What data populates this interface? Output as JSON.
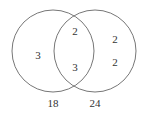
{
  "venn": {
    "sets": [
      {
        "name": "left-set",
        "label": "18"
      },
      {
        "name": "right-set",
        "label": "24"
      }
    ],
    "regions": {
      "left_only": [
        "3"
      ],
      "intersection": [
        "2",
        "3"
      ],
      "right_only": [
        "2",
        "2"
      ]
    },
    "colors": {
      "stroke": "#777777",
      "text": "#333333"
    }
  }
}
